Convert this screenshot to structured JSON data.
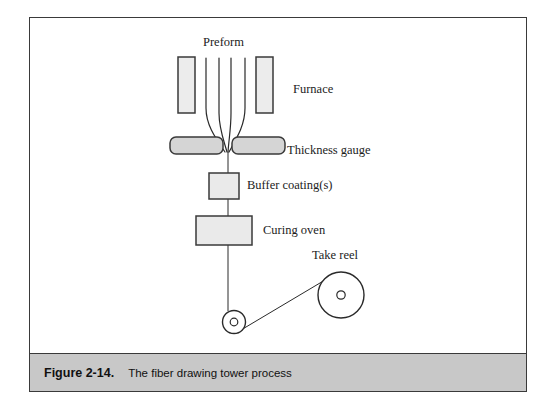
{
  "figure": {
    "number": "Figure 2-14.",
    "caption": "The fiber drawing tower process"
  },
  "diagram": {
    "title": "fiber drawing tower process",
    "labels": {
      "preform": "Preform",
      "furnace": "Furnace",
      "thickness_gauge": "Thickness gauge",
      "buffer_coating": "Buffer coating(s)",
      "curing_oven": "Curing oven",
      "take_reel": "Take reel"
    }
  },
  "colors": {
    "outline": "#3a3a3a",
    "stroke": "#2a2a2a",
    "furnace_fill": "#ececec",
    "gauge_fill": "#d5d5d5",
    "box_fill": "#eaeaea",
    "caption_bar": "#c8c8c8",
    "text": "#1c1c1c",
    "page_background": "#ffffff"
  }
}
